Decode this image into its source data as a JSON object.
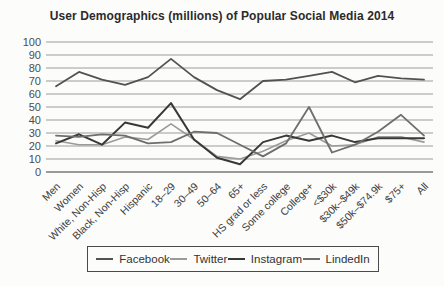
{
  "chart_data": {
    "type": "line",
    "title": "User Demographics (millions) of Popular Social Media 2014",
    "categories": [
      "Men",
      "Women",
      "White, Non-Hisp",
      "Black, Non-Hisp",
      "Hispanic",
      "18–29",
      "30–49",
      "50–64",
      "65+",
      "HS grad or less",
      "Some college",
      "College+",
      "<$30k",
      "$30k–$49k",
      "$50k–$74.9k",
      "$75+",
      "All"
    ],
    "series": [
      {
        "name": "Facebook",
        "color": "#525252",
        "width": 1.8,
        "values": [
          66,
          77,
          71,
          67,
          73,
          87,
          73,
          63,
          56,
          70,
          71,
          74,
          77,
          69,
          74,
          72,
          71
        ]
      },
      {
        "name": "Twitter",
        "color": "#9b9b9b",
        "width": 1.6,
        "values": [
          24,
          21,
          21,
          27,
          25,
          37,
          25,
          12,
          10,
          16,
          24,
          30,
          20,
          21,
          27,
          27,
          23
        ]
      },
      {
        "name": "Instagram",
        "color": "#383838",
        "width": 2,
        "values": [
          22,
          29,
          21,
          38,
          34,
          53,
          25,
          11,
          6,
          23,
          28,
          24,
          28,
          23,
          26,
          26,
          26
        ]
      },
      {
        "name": "LindedIn",
        "color": "#6e6e6e",
        "width": 1.8,
        "values": [
          28,
          27,
          29,
          28,
          22,
          23,
          31,
          30,
          21,
          12,
          22,
          50,
          15,
          21,
          31,
          44,
          28
        ]
      }
    ],
    "xlabel": "",
    "ylabel": "",
    "ylim": [
      0,
      100
    ],
    "ytick_step": 10,
    "ytick_labels": [
      "0",
      "10",
      "20",
      "30",
      "40",
      "50",
      "60",
      "70",
      "80",
      "90",
      "100"
    ],
    "grid": "horizontal",
    "legend_position": "bottom",
    "grid_color": "#9c9c9c",
    "axis_zero_color": "#7a7a7a"
  }
}
